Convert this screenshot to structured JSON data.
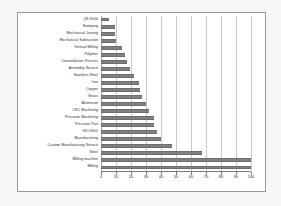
{
  "chart_data": {
    "type": "bar",
    "orientation": "horizontal",
    "title": "",
    "xlabel": "",
    "ylabel": "",
    "xlim": [
      0,
      100
    ],
    "grid": true,
    "legend": false,
    "bar_color": "#808080",
    "categories": [
      "QS 9000",
      "Stamping",
      "Mechanical Joining",
      "Mechanical Subtraction",
      "Vertical Milling",
      "Polymer",
      "Consolidation Process",
      "Assembly Service",
      "Stainless Steel",
      "Iron",
      "Copper",
      "Brass",
      "Aluminum",
      "CNC Machining",
      "Precision Machining",
      "Precision Part",
      "ISO 9001",
      "Manufacturing",
      "Custom Manufacturing Service",
      "Steel",
      "Milling machine",
      "Milling"
    ],
    "values": [
      5,
      9,
      9,
      10,
      14,
      16,
      17,
      19,
      22,
      25,
      26,
      27,
      30,
      32,
      35,
      35,
      37,
      40,
      47,
      67,
      100,
      100
    ],
    "xticks": [
      0,
      10,
      20,
      30,
      40,
      50,
      60,
      70,
      80,
      90,
      100
    ],
    "xtick_labels": [
      "0",
      "10",
      "20",
      "30",
      "40",
      "50",
      "60",
      "70",
      "80",
      "90",
      "100"
    ]
  }
}
